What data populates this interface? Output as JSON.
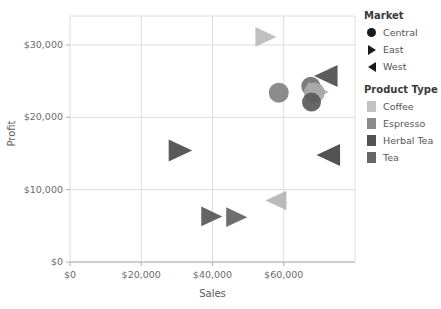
{
  "chart_data": {
    "type": "scatter",
    "title": "",
    "xlabel": "Sales",
    "ylabel": "Profit",
    "xlim": [
      0,
      80000
    ],
    "ylim": [
      0,
      34000
    ],
    "xticks": [
      "$0",
      "$20,000",
      "$40,000",
      "$60,000"
    ],
    "xtick_values": [
      0,
      20000,
      40000,
      60000
    ],
    "yticks": [
      "$0",
      "$10,000",
      "$20,000",
      "$30,000"
    ],
    "ytick_values": [
      0,
      10000,
      20000,
      30000
    ],
    "grid": true,
    "legend_position": "right",
    "encodings": {
      "shape": "Market",
      "color": "Product Type"
    },
    "points": [
      {
        "sales": 55000,
        "profit": 31100,
        "market": "East",
        "product": "Coffee",
        "shape": "triangle-right",
        "color": "#b9b9b9",
        "size": 17
      },
      {
        "sales": 71800,
        "profit": 25700,
        "market": "West",
        "product": "Herbal Tea",
        "shape": "triangle-left",
        "color": "#4a4a4a",
        "size": 19
      },
      {
        "sales": 67600,
        "profit": 24300,
        "market": "Central",
        "product": "Tea",
        "shape": "circle",
        "color": "#6d6d6d",
        "size": 19
      },
      {
        "sales": 69700,
        "profit": 23500,
        "market": "East",
        "product": "Coffee",
        "shape": "triangle-right",
        "color": "#b0b0b0",
        "size": 17
      },
      {
        "sales": 68600,
        "profit": 23400,
        "market": "Central",
        "product": "Coffee",
        "shape": "circle",
        "color": "#a8a8a8",
        "size": 21
      },
      {
        "sales": 58600,
        "profit": 23400,
        "market": "Central",
        "product": "Espresso",
        "shape": "circle",
        "color": "#808080",
        "size": 20
      },
      {
        "sales": 67800,
        "profit": 22100,
        "market": "Central",
        "product": "Herbal Tea",
        "shape": "circle",
        "color": "#585858",
        "size": 19
      },
      {
        "sales": 31000,
        "profit": 15400,
        "market": "East",
        "product": "Herbal Tea",
        "shape": "triangle-right",
        "color": "#474747",
        "size": 19
      },
      {
        "sales": 72500,
        "profit": 14800,
        "market": "West",
        "product": "Tea",
        "shape": "triangle-left",
        "color": "#3f3f3f",
        "size": 19
      },
      {
        "sales": 57800,
        "profit": 8500,
        "market": "West",
        "product": "Coffee",
        "shape": "triangle-left",
        "color": "#b4b4b4",
        "size": 17
      },
      {
        "sales": 39800,
        "profit": 6300,
        "market": "East",
        "product": "Tea",
        "shape": "triangle-right",
        "color": "#535353",
        "size": 17
      },
      {
        "sales": 46800,
        "profit": 6200,
        "market": "East",
        "product": "Espresso",
        "shape": "triangle-right",
        "color": "#5e5e5e",
        "size": 17
      }
    ]
  },
  "legend": {
    "market": {
      "title": "Market",
      "items": [
        {
          "label": "Central",
          "shape": "circle"
        },
        {
          "label": "East",
          "shape": "triangle-right"
        },
        {
          "label": "West",
          "shape": "triangle-left"
        }
      ]
    },
    "product_type": {
      "title": "Product Type",
      "items": [
        {
          "label": "Coffee",
          "color": "#c2c2c2"
        },
        {
          "label": "Espresso",
          "color": "#8a8a8a"
        },
        {
          "label": "Herbal Tea",
          "color": "#525252"
        },
        {
          "label": "Tea",
          "color": "#666666"
        }
      ]
    }
  },
  "colors": {
    "grid": "#dcdcdc",
    "axis": "#b0b0b0",
    "tick_text": "#6b6b6b",
    "title_text": "#3a3a3a"
  }
}
